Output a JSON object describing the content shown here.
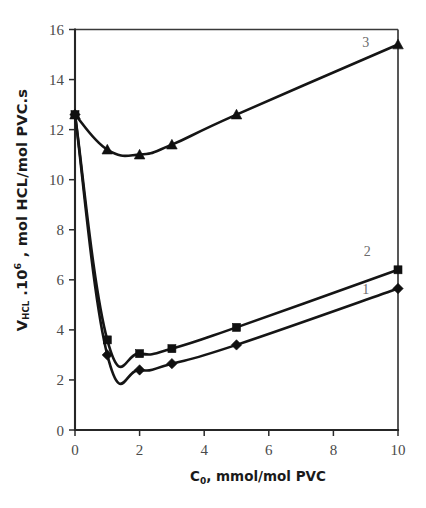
{
  "chart_data": {
    "type": "line",
    "title": "",
    "xlabel": "C0, mmol/mol PVC",
    "ylabel": "VHCL .10^6 , mol HCL/mol PVC.s",
    "xlim": [
      0,
      10
    ],
    "ylim": [
      0,
      16
    ],
    "xticks": [
      0,
      2,
      4,
      6,
      8,
      10
    ],
    "yticks": [
      0,
      2,
      4,
      6,
      8,
      10,
      12,
      14,
      16
    ],
    "grid": false,
    "legend_position": "inline-end-labels",
    "series": [
      {
        "name": "1",
        "label": "1",
        "marker": "diamond",
        "x": [
          0,
          1,
          2,
          3,
          5,
          10
        ],
        "y": [
          12.6,
          3.0,
          2.4,
          2.65,
          3.4,
          5.65
        ]
      },
      {
        "name": "2",
        "label": "2",
        "marker": "square",
        "x": [
          0,
          1,
          2,
          3,
          5,
          10
        ],
        "y": [
          12.6,
          3.6,
          3.05,
          3.25,
          4.1,
          6.4
        ]
      },
      {
        "name": "3",
        "label": "3",
        "marker": "triangle",
        "x": [
          0,
          1,
          2,
          3,
          5,
          10
        ],
        "y": [
          12.6,
          11.2,
          11.0,
          11.4,
          12.6,
          15.4
        ]
      }
    ]
  },
  "axis": {
    "y_label_main": "V",
    "y_label_sub": "HCL",
    "y_label_mid": " .10",
    "y_label_sup": "6",
    "y_label_rest": " , mol HCL/mol PVC.s",
    "x_label_main": "C",
    "x_label_sub": "0",
    "x_label_rest": ", mmol/mol PVC"
  },
  "ticks": {
    "x": [
      "0",
      "2",
      "4",
      "6",
      "8",
      "10"
    ],
    "y": [
      "0",
      "2",
      "4",
      "6",
      "8",
      "10",
      "12",
      "14",
      "16"
    ]
  },
  "curve_labels": {
    "one": "1",
    "two": "2",
    "three": "3"
  },
  "colors": {
    "axis": "#262626",
    "curve": "#151515",
    "tick_text": "#4a4a4a",
    "label_text": "#6b6b6b",
    "background": "#ffffff"
  }
}
